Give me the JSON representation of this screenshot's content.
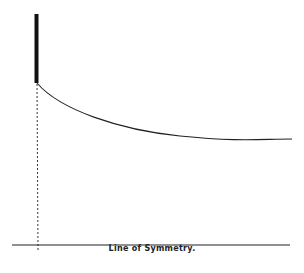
{
  "diagram": {
    "axis_label": "Line of Symmetry.",
    "colors": {
      "ink": "#1a1a1a",
      "background": "#ffffff"
    },
    "elements": {
      "thick_bar": {
        "x": 36,
        "y1": 14,
        "y2": 83
      },
      "curve": "decaying curve from bar base to horizontal asymptote",
      "dashed_projection": {
        "x": 37,
        "y1": 83,
        "y2": 250
      },
      "baseline": {
        "y": 245,
        "x1": 12,
        "x2": 290
      }
    }
  }
}
